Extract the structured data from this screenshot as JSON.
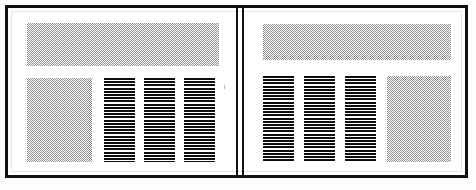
{
  "document": {
    "kind": "scanned-two-page-spread",
    "width": 476,
    "height": 190,
    "page_background": "#ffffff",
    "canvas_background": "#fdfdfd",
    "frame_color": "#111111",
    "frame_thickness_px": 3,
    "gutter_rule_count": 2
  },
  "textures": {
    "dither_color": "#8d8d8d",
    "dither_cell_px": 2,
    "line_color": "#0d0d0d",
    "line_thickness_px": 2,
    "line_period_px": 3.2
  },
  "pages": [
    {
      "id": "left",
      "name": "Left page",
      "blocks": [
        {
          "name": "headline-band",
          "texture": "dither",
          "left": 16,
          "top": 12,
          "width": 192,
          "height": 43
        },
        {
          "name": "figure-panel",
          "texture": "dither",
          "left": 16,
          "top": 67,
          "width": 65,
          "height": 84
        },
        {
          "name": "text-column-1",
          "texture": "lines",
          "left": 93,
          "top": 67,
          "width": 31,
          "height": 84
        },
        {
          "name": "text-column-2",
          "texture": "lines",
          "left": 133,
          "top": 67,
          "width": 31,
          "height": 84
        },
        {
          "name": "text-column-3",
          "texture": "lines",
          "left": 173,
          "top": 67,
          "width": 31,
          "height": 84
        }
      ],
      "specks": [
        {
          "left": 213,
          "top": 74,
          "width": 1,
          "height": 4
        }
      ]
    },
    {
      "id": "right",
      "name": "Right page",
      "blocks": [
        {
          "name": "headline-band",
          "texture": "dither",
          "left": 19,
          "top": 13,
          "width": 188,
          "height": 36
        },
        {
          "name": "text-column-1",
          "texture": "lines",
          "left": 19,
          "top": 65,
          "width": 31,
          "height": 86
        },
        {
          "name": "text-column-2",
          "texture": "lines",
          "left": 60,
          "top": 65,
          "width": 31,
          "height": 86
        },
        {
          "name": "text-column-3",
          "texture": "lines",
          "left": 101,
          "top": 65,
          "width": 31,
          "height": 86
        },
        {
          "name": "figure-panel",
          "texture": "dither",
          "left": 143,
          "top": 65,
          "width": 64,
          "height": 86
        }
      ],
      "specks": []
    }
  ]
}
